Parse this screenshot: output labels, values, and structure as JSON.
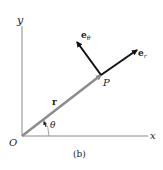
{
  "figure": {
    "caption": "(b)",
    "labels": {
      "origin": "O",
      "x_axis": "x",
      "y_axis": "y",
      "point": "P",
      "position_vector": "r",
      "angle": "θ",
      "unit_radial_base": "e",
      "unit_radial_sub": "r",
      "unit_transverse_base": "e",
      "unit_transverse_sub": "θ"
    },
    "colors": {
      "axes": "#8a8a8a",
      "position_vector": "#8c8c8c",
      "unit_vectors": "#111111",
      "text": "#222222"
    }
  }
}
